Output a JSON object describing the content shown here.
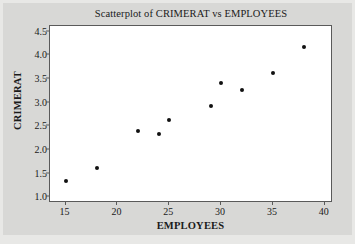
{
  "chart_data": {
    "type": "scatter",
    "title": "Scatterplot of CRIMERAT vs EMPLOYEES",
    "xlabel": "EMPLOYEES",
    "ylabel": "CRIMERAT",
    "xlim": [
      13.5,
      40.8
    ],
    "ylim": [
      0.88,
      4.62
    ],
    "xticks": [
      15,
      20,
      25,
      30,
      35,
      40
    ],
    "xtick_labels": [
      "15",
      "20",
      "25",
      "30",
      "35",
      "40"
    ],
    "yticks": [
      1.0,
      1.5,
      2.0,
      2.5,
      3.0,
      3.5,
      4.0,
      4.5
    ],
    "ytick_labels": [
      "1.0",
      "1.5",
      "2.0",
      "2.5",
      "3.0",
      "3.5",
      "4.0",
      "4.5"
    ],
    "grid": false,
    "legend": false,
    "marker": "filled-circle",
    "marker_color": "#111111",
    "plot_background": "#ffffff",
    "figure_background": "#d8d8d6",
    "x": [
      15,
      18,
      22,
      24,
      25,
      29,
      30,
      32,
      35,
      38
    ],
    "y": [
      1.35,
      1.63,
      2.41,
      2.33,
      2.64,
      2.94,
      3.41,
      3.26,
      3.63,
      4.17
    ],
    "points": [
      {
        "x": 15,
        "y": 1.35
      },
      {
        "x": 18,
        "y": 1.63
      },
      {
        "x": 22,
        "y": 2.41
      },
      {
        "x": 24,
        "y": 2.33
      },
      {
        "x": 25,
        "y": 2.64
      },
      {
        "x": 29,
        "y": 2.94
      },
      {
        "x": 30,
        "y": 3.41
      },
      {
        "x": 32,
        "y": 3.26
      },
      {
        "x": 35,
        "y": 3.63
      },
      {
        "x": 38,
        "y": 4.17
      }
    ]
  }
}
